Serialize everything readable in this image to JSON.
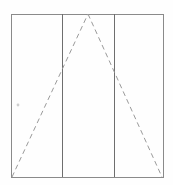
{
  "figure": {
    "canvas": {
      "width": 173,
      "height": 185,
      "background": "#fefefe"
    },
    "colors": {
      "rectangle_stroke": "#8a8a8a",
      "divider_stroke": "#6e6e6e",
      "triangle_stroke": "#9a9a9a",
      "speck": "#cfcfcf"
    },
    "rectangle": {
      "label": "outer rectangle",
      "x": 11,
      "y": 14,
      "width": 152,
      "height": 163,
      "stroke_width": 1
    },
    "dividers": [
      {
        "label": "left divider",
        "x": 62,
        "y1": 14,
        "y2": 177,
        "stroke_width": 1
      },
      {
        "label": "right divider",
        "x": 114,
        "y1": 14,
        "y2": 177,
        "stroke_width": 1
      }
    ],
    "triangle": {
      "label": "dashed isosceles triangle",
      "apex": {
        "x": 88,
        "y": 14
      },
      "base_left": {
        "x": 12,
        "y": 177
      },
      "base_right": {
        "x": 162,
        "y": 177
      },
      "stroke_width": 1,
      "dash_pattern": "5 3.5",
      "sides_drawn": [
        "left",
        "right"
      ],
      "base_drawn": false
    },
    "marks": [
      {
        "label": "faint speck",
        "x": 18,
        "y": 105,
        "radius": 1.4
      }
    ]
  }
}
